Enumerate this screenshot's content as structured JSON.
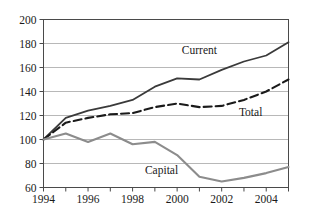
{
  "chart_data": {
    "type": "line",
    "title": "",
    "subtitle": "",
    "xlabel": "",
    "ylabel": "",
    "xlim": [
      1994,
      2005
    ],
    "ylim": [
      60,
      200
    ],
    "ytick_step": 20,
    "grid": true,
    "legend": "inline-labels",
    "x": [
      1994,
      1995,
      1996,
      1997,
      1998,
      1999,
      2000,
      2001,
      2002,
      2003,
      2004,
      2005
    ],
    "x_tick_labels": [
      "1994",
      "1996",
      "1998",
      "2000",
      "2002",
      "2004"
    ],
    "x_tick_values": [
      1994,
      1996,
      1998,
      2000,
      2002,
      2004
    ],
    "x_minor_tick_values": [
      1995,
      1997,
      1999,
      2001,
      2003,
      2005
    ],
    "y_tick_labels": [
      "200",
      "180",
      "160",
      "140",
      "120",
      "100",
      "80",
      "60"
    ],
    "y_tick_values": [
      200,
      180,
      160,
      140,
      120,
      100,
      80,
      60
    ],
    "series": [
      {
        "name": "Current",
        "label": "Current",
        "color": "#3a3a3a",
        "style": "solid",
        "width": 1.8,
        "values": [
          100,
          118,
          124,
          128,
          133,
          144,
          151,
          150,
          158,
          165,
          170,
          181
        ],
        "label_x": 2001.0,
        "label_y": 171
      },
      {
        "name": "Total",
        "label": "Total",
        "color": "#1a1a1a",
        "style": "dashed",
        "width": 2.1,
        "values": [
          100,
          114,
          118,
          121,
          122,
          127,
          130,
          127,
          128,
          133,
          140,
          150
        ],
        "label_x": 2003.3,
        "label_y": 120
      },
      {
        "name": "Capital",
        "label": "Capital",
        "color": "#8c8c8c",
        "style": "solid",
        "width": 2.1,
        "values": [
          100,
          105,
          98,
          105,
          96,
          98,
          87,
          69,
          65,
          68,
          72,
          77
        ],
        "label_x": 1999.3,
        "label_y": 71
      }
    ]
  }
}
